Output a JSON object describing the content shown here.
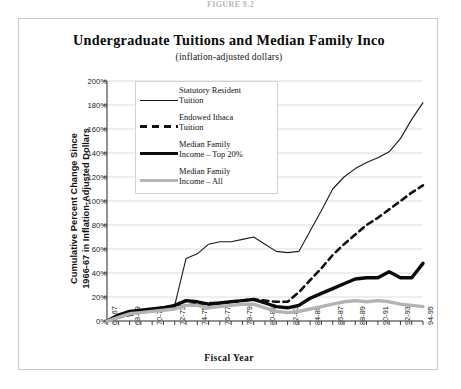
{
  "figure": {
    "caption": "FIGURE 9.2"
  },
  "chart": {
    "title": "Undergraduate Tuitions and Median Family Inco",
    "subtitle": "(inflation-adjusted dollars)"
  },
  "axes": {
    "ylabel_line1": "Cumulative Percent Change Since",
    "ylabel_line2": "1966-67 in Inflation-Adjusted Dollars",
    "xlabel": "Fiscal Year"
  },
  "legend": {
    "items": [
      {
        "label_line1": "Statutory Resident",
        "label_line2": "Tuition",
        "style": "thin",
        "color": "#1a1a1a"
      },
      {
        "label_line1": "Endowed Ithaca",
        "label_line2": "Tuition",
        "style": "dashed",
        "color": "#111111"
      },
      {
        "label_line1": "Median Family",
        "label_line2": "Income – Top 20%",
        "style": "thick",
        "color": "#0a0a0a"
      },
      {
        "label_line1": "Median Family",
        "label_line2": "Income – All",
        "style": "gray",
        "color": "#b3b3b3"
      }
    ]
  },
  "chart_data": {
    "type": "line",
    "title": "Undergraduate Tuitions and Median Family Inco",
    "subtitle": "(inflation-adjusted dollars)",
    "xlabel": "Fiscal Year",
    "ylabel": "Cumulative Percent Change Since 1966-67 in Inflation-Adjusted Dollars",
    "grid": true,
    "legend_position": "upper-left-inside",
    "ylim": [
      0,
      200
    ],
    "ytick_labels": [
      "0%",
      "20%",
      "40%",
      "60%",
      "80%",
      "100%",
      "120%",
      "140%",
      "160%",
      "180%",
      "200%"
    ],
    "ytick_values": [
      0,
      20,
      40,
      60,
      80,
      100,
      120,
      140,
      160,
      180,
      200
    ],
    "x": [
      "66-67",
      "67-68",
      "68-69",
      "69-70",
      "70-71",
      "71-72",
      "72-73",
      "73-74",
      "74-75",
      "75-76",
      "76-77",
      "77-78",
      "78-79",
      "79-80",
      "80-81",
      "81-82",
      "82-83",
      "83-84",
      "84-85",
      "85-86",
      "86-87",
      "87-88",
      "88-89",
      "89-90",
      "90-91",
      "91-92",
      "92-93",
      "93-94",
      "94-95"
    ],
    "xtick_labels": [
      "66-67",
      "68-69",
      "70-71",
      "72-73",
      "74-75",
      "76-77",
      "78-79",
      "80-81",
      "82-83",
      "84-85",
      "86-87",
      "88-89",
      "90-91",
      "92-93",
      "94-95"
    ],
    "series": [
      {
        "name": "Statutory Resident Tuition",
        "style": "thin-solid",
        "color": "#1a1a1a",
        "values": [
          0,
          4,
          7,
          9,
          10,
          12,
          13,
          52,
          56,
          64,
          66,
          66,
          68,
          70,
          64,
          58,
          57,
          58,
          75,
          92,
          110,
          120,
          127,
          132,
          136,
          141,
          152,
          168,
          182
        ]
      },
      {
        "name": "Endowed Ithaca Tuition",
        "style": "dashed",
        "color": "#111111",
        "values": [
          0,
          3,
          5,
          7,
          9,
          10,
          11,
          13,
          14,
          15,
          15,
          16,
          17,
          18,
          17,
          16,
          16,
          24,
          34,
          44,
          55,
          64,
          72,
          80,
          86,
          93,
          100,
          107,
          113
        ]
      },
      {
        "name": "Median Family Income – Top 20%",
        "style": "thick-solid",
        "color": "#0a0a0a",
        "values": [
          0,
          5,
          8,
          9,
          10,
          11,
          13,
          17,
          16,
          14,
          15,
          16,
          17,
          18,
          15,
          12,
          11,
          13,
          19,
          23,
          27,
          31,
          35,
          36,
          36,
          41,
          36,
          36,
          48
        ]
      },
      {
        "name": "Median Family Income – All",
        "style": "thick-gray",
        "color": "#b3b3b3",
        "values": [
          0,
          3,
          6,
          7,
          8,
          9,
          10,
          13,
          13,
          11,
          12,
          13,
          14,
          14,
          11,
          8,
          7,
          8,
          10,
          12,
          14,
          16,
          17,
          16,
          17,
          16,
          14,
          13,
          12
        ]
      }
    ]
  }
}
